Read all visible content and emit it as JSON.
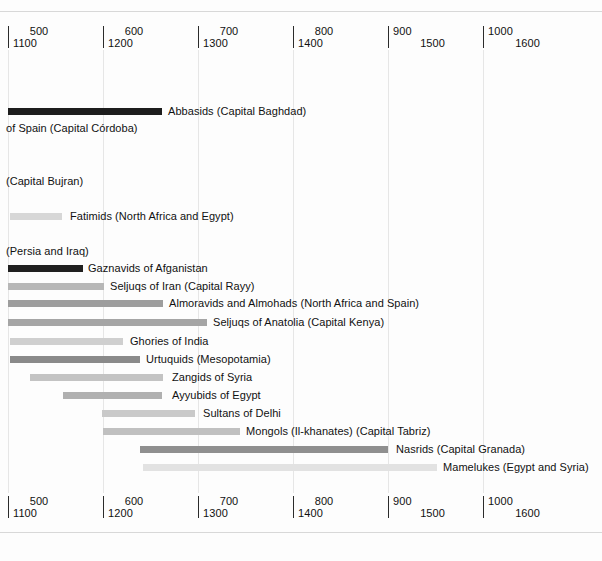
{
  "chart_data": {
    "type": "bar",
    "orientation": "horizontal",
    "title": "",
    "subtitle": "",
    "xlabel": "",
    "ylabel": "",
    "grid": true,
    "legend": null,
    "axis": {
      "note": "dual calendar axis: upper row = Hijri (AH) years, lower row = Gregorian (CE) years",
      "hijri_ticks": [
        500,
        600,
        700,
        800,
        900,
        1000
      ],
      "gregorian_ticks": [
        1100,
        1200,
        1300,
        1400,
        1500,
        1600
      ],
      "hijri_range": [
        500,
        1000
      ],
      "gregorian_range": [
        1100,
        1600
      ],
      "tick_positions_px": [
        8,
        103,
        198,
        293,
        388,
        483
      ],
      "px_per_100_years": 95,
      "duplicated_top_and_bottom": true
    },
    "ticks": [
      {
        "hijri": "500",
        "gregorian": "1100",
        "x": 8,
        "align": "left"
      },
      {
        "hijri": "600",
        "gregorian": "1200",
        "x": 103,
        "align": "left"
      },
      {
        "hijri": "700",
        "gregorian": "1300",
        "x": 198,
        "align": "left"
      },
      {
        "hijri": "800",
        "gregorian": "1400",
        "x": 293,
        "align": "left"
      },
      {
        "hijri": "900",
        "gregorian": "1500",
        "x": 388,
        "align": "right"
      },
      {
        "hijri": "1000",
        "gregorian": "1600",
        "x": 483,
        "align": "right"
      }
    ],
    "categories": [
      "Abbasids (Capital Baghdad)",
      "of Spain (Capital Córdoba)",
      "(Capital Bujran)",
      "Fatimids (North Africa and Egypt)",
      "(Persia and Iraq)",
      "Gaznavids of Afganistan",
      "Seljuqs of Iran (Capital Rayy)",
      "Almoravids and Almohads (North Africa and Spain)",
      "Seljuqs of Anatolia (Capital Kenya)",
      "Ghories of India",
      "Urtuquids (Mesopotamia)",
      "Zangids of Syria",
      "Ayyubids of Egypt",
      "Sultans of Delhi",
      "Mongols (Il-khanates) (Capital Tabriz)",
      "Nasrids (Capital Granada)",
      "Mamelukes (Egypt and Syria)"
    ],
    "bars": [
      {
        "label": "Abbasids (Capital Baghdad)",
        "y": 108,
        "x_start": 8,
        "x_end": 162,
        "color": "#1d1d1d",
        "label_x": 168,
        "start_gregorian": 1100,
        "end_gregorian": 1262,
        "has_bar": true
      },
      {
        "label": "of Spain (Capital Córdoba)",
        "y": 125,
        "x_start": 0,
        "x_end": 0,
        "color": "#bdbdbd",
        "label_x": 6,
        "start_gregorian": null,
        "end_gregorian": null,
        "has_bar": false
      },
      {
        "label": "(Capital Bujran)",
        "y": 178,
        "x_start": 0,
        "x_end": 0,
        "color": "#bdbdbd",
        "label_x": 6,
        "start_gregorian": null,
        "end_gregorian": null,
        "has_bar": false
      },
      {
        "label": "Fatimids (North Africa and Egypt)",
        "y": 213,
        "x_start": 10,
        "x_end": 62,
        "color": "#d7d7d7",
        "label_x": 70,
        "start_gregorian": 1102,
        "end_gregorian": 1157,
        "has_bar": true
      },
      {
        "label": "(Persia and Iraq)",
        "y": 248,
        "x_start": 0,
        "x_end": 0,
        "color": "#bdbdbd",
        "label_x": 6,
        "start_gregorian": null,
        "end_gregorian": null,
        "has_bar": false
      },
      {
        "label": "Gaznavids of Afganistan",
        "y": 265,
        "x_start": 8,
        "x_end": 83,
        "color": "#202020",
        "label_x": 88,
        "start_gregorian": 1100,
        "end_gregorian": 1179,
        "has_bar": true
      },
      {
        "label": "Seljuqs of Iran (Capital Rayy)",
        "y": 283,
        "x_start": 8,
        "x_end": 104,
        "color": "#b7b7b7",
        "label_x": 110,
        "start_gregorian": 1100,
        "end_gregorian": 1201,
        "has_bar": true
      },
      {
        "label": "Almoravids and Almohads (North Africa and Spain)",
        "y": 300,
        "x_start": 8,
        "x_end": 163,
        "color": "#9d9d9d",
        "label_x": 169,
        "start_gregorian": 1100,
        "end_gregorian": 1263,
        "has_bar": true
      },
      {
        "label": "Seljuqs of Anatolia (Capital Kenya)",
        "y": 319,
        "x_start": 8,
        "x_end": 207,
        "color": "#a5a5a5",
        "label_x": 213,
        "start_gregorian": 1100,
        "end_gregorian": 1309,
        "has_bar": true
      },
      {
        "label": "Ghories of India",
        "y": 338,
        "x_start": 10,
        "x_end": 123,
        "color": "#cfcfcf",
        "label_x": 130,
        "start_gregorian": 1102,
        "end_gregorian": 1221,
        "has_bar": true
      },
      {
        "label": "Urtuquids (Mesopotamia)",
        "y": 356,
        "x_start": 10,
        "x_end": 140,
        "color": "#8a8a8a",
        "label_x": 146,
        "start_gregorian": 1102,
        "end_gregorian": 1239,
        "has_bar": true
      },
      {
        "label": "Zangids of Syria",
        "y": 374,
        "x_start": 30,
        "x_end": 163,
        "color": "#c3c3c3",
        "label_x": 172,
        "start_gregorian": 1123,
        "end_gregorian": 1263,
        "has_bar": true
      },
      {
        "label": "Ayyubids of Egypt",
        "y": 392,
        "x_start": 63,
        "x_end": 162,
        "color": "#b0b0b0",
        "label_x": 172,
        "start_gregorian": 1158,
        "end_gregorian": 1262,
        "has_bar": true
      },
      {
        "label": "Sultans of Delhi",
        "y": 410,
        "x_start": 102,
        "x_end": 195,
        "color": "#c9c9c9",
        "label_x": 203,
        "start_gregorian": 1199,
        "end_gregorian": 1297,
        "has_bar": true
      },
      {
        "label": "Mongols (Il-khanates) (Capital Tabriz)",
        "y": 428,
        "x_start": 103,
        "x_end": 240,
        "color": "#c0c0c0",
        "label_x": 246,
        "start_gregorian": 1200,
        "end_gregorian": 1344,
        "has_bar": true
      },
      {
        "label": "Nasrids (Capital Granada)",
        "y": 446,
        "x_start": 140,
        "x_end": 388,
        "color": "#8f8f8f",
        "label_x": 396,
        "start_gregorian": 1239,
        "end_gregorian": 1500,
        "has_bar": true
      },
      {
        "label": "Mamelukes (Egypt and Syria)",
        "y": 464,
        "x_start": 143,
        "x_end": 437,
        "color": "#e2e2e2",
        "label_x": 443,
        "start_gregorian": 1242,
        "end_gregorian": 1552,
        "has_bar": true
      }
    ]
  },
  "colors": {
    "background": "#fdfdfd",
    "text": "#111111",
    "gridline": "#e6e6e6",
    "tick": "#2b2b2b",
    "frame_rule": "#d8d8d8"
  }
}
